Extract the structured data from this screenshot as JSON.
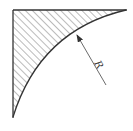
{
  "diagram": {
    "type": "hatched fillet region with radius dimension",
    "label_radius": "R",
    "colors": {
      "line": "#333333",
      "hatch": "#555555",
      "background": "#ffffff"
    }
  }
}
